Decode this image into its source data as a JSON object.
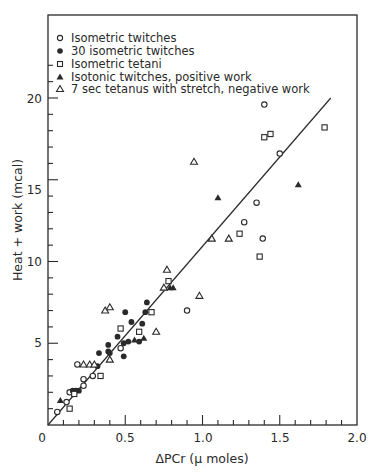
{
  "chart_data": {
    "type": "scatter",
    "title": "",
    "xlabel": "ΔPCr (μ moles)",
    "ylabel": "Heat + work  (mcal)",
    "xlim": [
      0,
      2.0
    ],
    "ylim": [
      0,
      22.5
    ],
    "x_ticks": [
      0,
      0.5,
      1.0,
      1.5,
      2.0
    ],
    "x_tick_labels": [
      "0",
      "0.5",
      "1.0",
      "1.5",
      "2.0"
    ],
    "x_minor_step": 0.1,
    "y_ticks": [
      5,
      10,
      15,
      20
    ],
    "y_tick_labels": [
      "5",
      "10",
      "15",
      "20"
    ],
    "y_minor_step": 1,
    "grid": false,
    "legend_position": "upper-left",
    "fit_line": {
      "x": [
        0,
        1.83
      ],
      "y": [
        0,
        20.0
      ]
    },
    "series": [
      {
        "name": "Isometric twitches",
        "marker": "open-circle",
        "points": [
          [
            0.06,
            0.8
          ],
          [
            0.12,
            1.4
          ],
          [
            0.14,
            2.0
          ],
          [
            0.19,
            3.7
          ],
          [
            0.23,
            2.4
          ],
          [
            0.23,
            2.8
          ],
          [
            0.29,
            3.0
          ],
          [
            0.47,
            4.7
          ],
          [
            0.9,
            7.0
          ],
          [
            1.27,
            12.4
          ],
          [
            1.35,
            13.6
          ],
          [
            1.39,
            11.4
          ],
          [
            1.4,
            19.6
          ],
          [
            1.5,
            16.6
          ]
        ]
      },
      {
        "name": "30 isometric twitches",
        "marker": "filled-circle",
        "points": [
          [
            0.16,
            2.1
          ],
          [
            0.18,
            2.1
          ],
          [
            0.2,
            2.1
          ],
          [
            0.32,
            3.6
          ],
          [
            0.33,
            4.4
          ],
          [
            0.39,
            4.5
          ],
          [
            0.39,
            4.9
          ],
          [
            0.4,
            4.4
          ],
          [
            0.45,
            5.4
          ],
          [
            0.49,
            4.2
          ],
          [
            0.49,
            5.0
          ],
          [
            0.52,
            5.1
          ],
          [
            0.5,
            6.9
          ],
          [
            0.54,
            6.3
          ],
          [
            0.59,
            5.1
          ],
          [
            0.61,
            6.2
          ],
          [
            0.63,
            6.9
          ],
          [
            0.64,
            7.5
          ]
        ]
      },
      {
        "name": "Isometric tetani",
        "marker": "open-square",
        "points": [
          [
            0.14,
            1.0
          ],
          [
            0.17,
            1.9
          ],
          [
            0.34,
            3.0
          ],
          [
            0.47,
            5.9
          ],
          [
            0.59,
            5.7
          ],
          [
            0.67,
            6.9
          ],
          [
            0.78,
            8.8
          ],
          [
            1.24,
            11.7
          ],
          [
            1.37,
            10.3
          ],
          [
            1.4,
            17.6
          ],
          [
            1.44,
            17.8
          ],
          [
            1.79,
            18.2
          ]
        ]
      },
      {
        "name": "Isotonic twitches, positive work",
        "marker": "filled-triangle",
        "points": [
          [
            0.08,
            1.5
          ],
          [
            0.56,
            5.2
          ],
          [
            0.62,
            5.3
          ],
          [
            0.79,
            8.4
          ],
          [
            0.81,
            8.4
          ],
          [
            1.1,
            13.9
          ],
          [
            1.62,
            14.7
          ]
        ]
      },
      {
        "name": "7 sec  tetanus with stretch, negative work",
        "marker": "open-triangle",
        "points": [
          [
            0.23,
            3.7
          ],
          [
            0.27,
            3.7
          ],
          [
            0.3,
            3.7
          ],
          [
            0.37,
            7.0
          ],
          [
            0.4,
            7.2
          ],
          [
            0.4,
            4.0
          ],
          [
            0.7,
            5.7
          ],
          [
            0.75,
            8.4
          ],
          [
            0.77,
            9.5
          ],
          [
            0.945,
            16.1
          ],
          [
            0.98,
            7.9
          ],
          [
            1.06,
            11.4
          ],
          [
            1.17,
            11.4
          ]
        ]
      }
    ]
  },
  "legend": {
    "items": [
      {
        "symbol": "open-circle",
        "label": "Isometric twitches"
      },
      {
        "symbol": "filled-circle",
        "label": "30  isometric twitches"
      },
      {
        "symbol": "open-square",
        "label": "Isometric tetani"
      },
      {
        "symbol": "filled-triangle",
        "label": "Isotonic twitches,  positive work"
      },
      {
        "symbol": "open-triangle",
        "label": "7 sec   tetanus with stretch, negative work"
      }
    ]
  },
  "axes": {
    "x_title": "ΔPCr (μ moles)",
    "y_title": "Heat + work  (mcal)",
    "x_labels": [
      "0",
      "0.5",
      "1.0",
      "1.5",
      "2.0"
    ],
    "y_labels": [
      "5",
      "10",
      "15",
      "20"
    ]
  },
  "colors": {
    "ink": "#2a2a2a",
    "background": "#ffffff"
  }
}
